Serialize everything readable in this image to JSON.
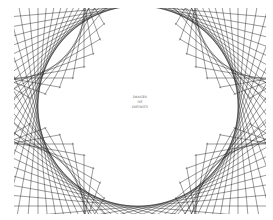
{
  "artwork": {
    "title_lines": [
      "IMAGES",
      "OF",
      "INFINITY"
    ],
    "line_color": "#1a1a1a",
    "background": "#ffffff",
    "frame": {
      "x": 14,
      "y": 8,
      "w": 252,
      "h": 206
    },
    "circle": {
      "cx": 138,
      "cy": 106,
      "r": 100
    },
    "chord_count": 72
  }
}
